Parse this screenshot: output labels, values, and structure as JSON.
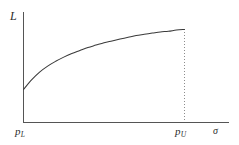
{
  "figure": {
    "background_color": "#ffffff",
    "line_color": "#3a3a3a",
    "axis_color": "#555555",
    "dashed_color": "#8c8c8c",
    "text_color": "#2b2b2b"
  },
  "labels": {
    "y_axis": "L",
    "x_axis": "σ",
    "tick_left_base": "p",
    "tick_left_sub": "L",
    "tick_right_base": "p",
    "tick_right_sub": "U"
  },
  "chart_data": {
    "type": "line",
    "title": "",
    "xlabel": "σ",
    "ylabel": "L",
    "xlim": [
      0,
      1
    ],
    "ylim": [
      0,
      1
    ],
    "grid": false,
    "legend": null,
    "x_tick_labels": [
      "p_L",
      "p_U"
    ],
    "y_tick_labels": [],
    "annotations": [
      {
        "name": "vertical-dashed-at-pU",
        "type": "vline",
        "x": 1.0,
        "style": "dotted",
        "from_y": 0.0,
        "to_y": 1.0
      }
    ],
    "series": [
      {
        "name": "L(σ)",
        "style": "solid",
        "shape": "concave-increasing",
        "x": [
          0.0,
          0.05,
          0.1,
          0.15,
          0.2,
          0.25,
          0.3,
          0.35,
          0.4,
          0.45,
          0.5,
          0.55,
          0.6,
          0.65,
          0.7,
          0.75,
          0.8,
          0.85,
          0.9,
          0.95,
          1.0
        ],
        "y": [
          0.0,
          0.16,
          0.29,
          0.39,
          0.47,
          0.54,
          0.6,
          0.65,
          0.7,
          0.74,
          0.78,
          0.81,
          0.84,
          0.87,
          0.9,
          0.92,
          0.94,
          0.96,
          0.97,
          0.99,
          1.0
        ]
      }
    ]
  }
}
